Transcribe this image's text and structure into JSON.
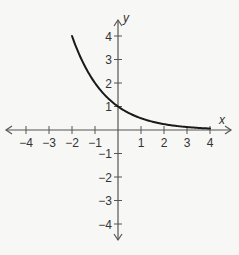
{
  "chart_data": {
    "type": "line",
    "title": "",
    "xlabel": "x",
    "ylabel": "y",
    "xlim": [
      -4,
      4
    ],
    "ylim": [
      -4,
      4
    ],
    "grid": false,
    "x_ticks": [
      -4,
      -3,
      -2,
      -1,
      1,
      2,
      3,
      4
    ],
    "y_ticks": [
      4,
      3,
      2,
      1,
      -1,
      -2,
      -3,
      -4
    ],
    "x_tick_labels": [
      "−4",
      "−3",
      "−2",
      "−1",
      "1",
      "2",
      "3",
      "4"
    ],
    "y_tick_labels": [
      "4",
      "3",
      "2",
      "1",
      "−1",
      "−2",
      "−3",
      "−4"
    ],
    "function": "y = 2^(-x)",
    "series": [
      {
        "name": "curve",
        "x": [
          -2,
          -1.5,
          -1,
          -0.5,
          0,
          0.5,
          1,
          1.5,
          2,
          2.5,
          3,
          3.5,
          4
        ],
        "y": [
          4,
          2.83,
          2,
          1.41,
          1,
          0.71,
          0.5,
          0.35,
          0.25,
          0.18,
          0.125,
          0.09,
          0.06
        ]
      }
    ]
  },
  "axes": {
    "x_name": "x",
    "y_name": "y"
  },
  "colors": {
    "background": "#f7f7f5",
    "axis": "#555555",
    "curve": "#1a1a1a",
    "text": "#333333"
  }
}
